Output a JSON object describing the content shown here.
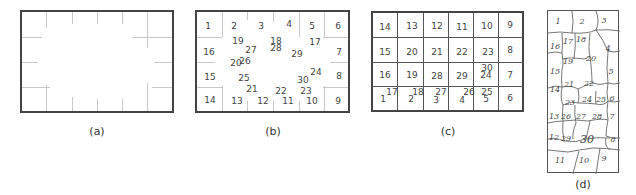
{
  "panels": [
    {
      "id": "a",
      "caption": "(a)",
      "description": "empty rectangular frame with perimeter tick marks"
    },
    {
      "id": "b",
      "caption": "(b)",
      "perimeter_labels": [
        "1",
        "2",
        "3",
        "4",
        "5",
        "6",
        "7",
        "8",
        "9",
        "10",
        "11",
        "12",
        "13",
        "14",
        "15",
        "16"
      ],
      "interior_labels": [
        "17",
        "18",
        "19",
        "20",
        "21",
        "22",
        "23",
        "24",
        "25",
        "26",
        "27",
        "28",
        "29",
        "30"
      ]
    },
    {
      "id": "c",
      "caption": "(c)",
      "grid_rows": [
        [
          "14",
          "13",
          "12",
          "11",
          "10",
          "9"
        ],
        [
          "15",
          "20",
          "21",
          "22",
          "23",
          "8"
        ],
        [
          "16",
          "19",
          "28",
          "29",
          "30/24",
          "7"
        ],
        [
          "1/17",
          "2/18",
          "3/27",
          "4/26",
          "5/25",
          "6"
        ]
      ]
    },
    {
      "id": "d",
      "caption": "(d)",
      "handwritten_labels": [
        "1",
        "2",
        "3",
        "16",
        "17",
        "18",
        "4",
        "19",
        "20",
        "15",
        "5",
        "14",
        "21",
        "22",
        "23",
        "24",
        "25",
        "6",
        "13",
        "26",
        "27",
        "28",
        "7",
        "12",
        "29",
        "30",
        "8",
        "11",
        "10",
        "9"
      ]
    }
  ],
  "labels": {
    "b": {
      "l1": "1",
      "l2": "2",
      "l3": "3",
      "l4": "4",
      "l5": "5",
      "l6": "6",
      "l7": "7",
      "l8": "8",
      "l9": "9",
      "l10": "10",
      "l11": "11",
      "l12": "12",
      "l13": "13",
      "l14": "14",
      "l15": "15",
      "l16": "16",
      "l17": "17",
      "l18": "18",
      "l19": "19",
      "l20": "20",
      "l21": "21",
      "l22": "22",
      "l23": "23",
      "l24": "24",
      "l25": "25",
      "l26": "26",
      "l27": "27",
      "l28": "28",
      "l29": "29",
      "l30": "30"
    },
    "c": {
      "r0c0": "14",
      "r0c1": "13",
      "r0c2": "12",
      "r0c3": "11",
      "r0c4": "10",
      "r0c5": "9",
      "r1c0": "15",
      "r1c1": "20",
      "r1c2": "21",
      "r1c3": "22",
      "r1c4": "23",
      "r1c5": "8",
      "r2c0": "16",
      "r2c1": "19",
      "r2c2": "28",
      "r2c3": "29",
      "r2c4a": "30",
      "r2c4b": "24",
      "r2c5": "7",
      "r3c0a": "1",
      "r3c0b": "17",
      "r3c1a": "2",
      "r3c1b": "18",
      "r3c2a": "3",
      "r3c2b": "27",
      "r3c3a": "4",
      "r3c3b": "26",
      "r3c4a": "5",
      "r3c4b": "25",
      "r3c5": "6"
    },
    "d": {
      "h1": "1",
      "h2": "2",
      "h3": "3",
      "h16": "16",
      "h17": "17",
      "h18": "18",
      "h4": "4",
      "h19": "19",
      "h20": "20",
      "h15": "15",
      "h5": "5",
      "h14": "14",
      "h21": "21",
      "h22": "22",
      "h23": "23",
      "h24": "24",
      "h25": "25",
      "h6": "6",
      "h13": "13",
      "h26": "26",
      "h27": "27",
      "h28": "28",
      "h7": "7",
      "h12": "12",
      "h29": "29",
      "h30": "30",
      "h8": "8",
      "h11": "11",
      "h10": "10",
      "h9": "9"
    }
  }
}
